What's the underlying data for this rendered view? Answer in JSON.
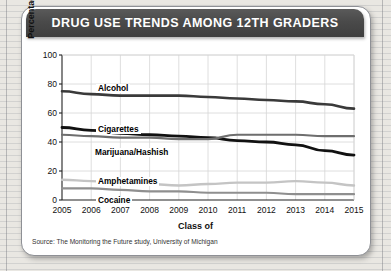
{
  "card": {
    "title": "DRUG USE TRENDS AMONG 12TH GRADERS",
    "source": "Source: The Monitoring the Future study, University of Michigan"
  },
  "colors": {
    "banner": "#454545",
    "card": "#ffffff",
    "grid": "#d6d6d6",
    "axis": "#222222",
    "alcohol": "#3a3a3a",
    "cigarettes": "#111111",
    "marijuana": "#6e6e6e",
    "amphetamines": "#c4c4c4",
    "cocaine": "#8f8f8f"
  },
  "chart_data": {
    "type": "line",
    "title": "DRUG USE TRENDS AMONG 12TH GRADERS",
    "xlabel": "Class of",
    "ylabel": "Percentage who ever used",
    "ylim": [
      0,
      100
    ],
    "yticks": [
      0,
      20,
      40,
      60,
      80,
      100
    ],
    "grid": true,
    "legend_position": "inline-labels",
    "categories": [
      2005,
      2006,
      2007,
      2008,
      2009,
      2010,
      2011,
      2012,
      2013,
      2014,
      2015
    ],
    "xtick_labels": [
      "2005",
      "2006",
      "2007",
      "2008",
      "2009",
      "2010",
      "2011",
      "2012",
      "2013",
      "2014",
      "2015"
    ],
    "series": [
      {
        "name": "Alcohol",
        "color": "#3a3a3a",
        "width": 2.6,
        "values": [
          75,
          73,
          72,
          72,
          72,
          71,
          70,
          69,
          68,
          66,
          63
        ]
      },
      {
        "name": "Cigarettes",
        "color": "#111111",
        "width": 2.8,
        "values": [
          50,
          48,
          46,
          45,
          44,
          43,
          41,
          40,
          38,
          34,
          31
        ]
      },
      {
        "name": "Marijuana/Hashish",
        "color": "#6e6e6e",
        "width": 2.2,
        "values": [
          45,
          44,
          43,
          43,
          42,
          42,
          45,
          45,
          45,
          44,
          44
        ]
      },
      {
        "name": "Amphetamines",
        "color": "#c4c4c4",
        "width": 2.4,
        "values": [
          14,
          13,
          12,
          11,
          10,
          11,
          12,
          12,
          13,
          12,
          10
        ]
      },
      {
        "name": "Cocaine",
        "color": "#8f8f8f",
        "width": 2.2,
        "values": [
          8,
          8,
          7,
          6,
          6,
          5,
          5,
          5,
          4,
          4,
          4
        ]
      }
    ],
    "inline_labels": [
      {
        "name": "Alcohol",
        "x": 96,
        "y": 84
      },
      {
        "name": "Cigarettes",
        "x": 96,
        "y": 125
      },
      {
        "name": "Marijuana/Hashish",
        "x": 93,
        "y": 148
      },
      {
        "name": "Amphetamines",
        "x": 96,
        "y": 177
      },
      {
        "name": "Cocaine",
        "x": 96,
        "y": 196
      }
    ]
  }
}
